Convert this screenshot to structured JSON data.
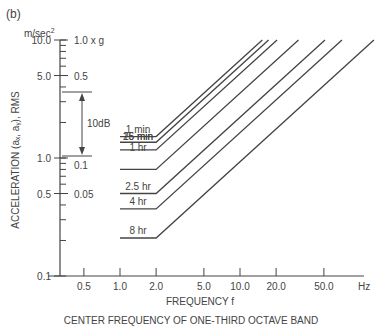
{
  "panel_label": "(b)",
  "y_unit": "m/sec²",
  "chart_data": {
    "type": "line",
    "title": "",
    "xlabel": "FREQUENCY f",
    "x_unit": "Hz",
    "caption": "CENTER FREQUENCY OF ONE-THIRD OCTAVE BAND",
    "ylabel": "ACCELERATION (aₓ, aᵧ), RMS",
    "x_scale": "log",
    "y_scale": "log",
    "xlim": [
      0.3,
      80
    ],
    "ylim": [
      0.1,
      10.0
    ],
    "x_ticks": [
      "0.5",
      "1.0",
      "2.0",
      "5.0",
      "10.0",
      "20.0",
      "50.0"
    ],
    "y_ticks": [
      "0.1",
      "0.5",
      "1.0",
      "5.0",
      "10.0"
    ],
    "y_ticks_g": [
      "0.05",
      "0.1",
      "0.5",
      "1.0 x g"
    ],
    "annotation": "10dB",
    "series": [
      {
        "name": "1 min",
        "flat_value": 1.52,
        "x_start": 1.0,
        "x_corner": 2.0
      },
      {
        "name": "16 min",
        "flat_value": 1.36,
        "x_start": 1.0,
        "x_corner": 2.0
      },
      {
        "name": "25 min",
        "flat_value": 1.17,
        "x_start": 1.0,
        "x_corner": 2.0
      },
      {
        "name": "1 hr",
        "flat_value": 0.8,
        "x_start": 1.0,
        "x_corner": 2.0
      },
      {
        "name": "2.5 hr",
        "flat_value": 0.5,
        "x_start": 1.0,
        "x_corner": 2.0
      },
      {
        "name": "4 hr",
        "flat_value": 0.37,
        "x_start": 1.0,
        "x_corner": 2.0
      },
      {
        "name": "8 hr",
        "flat_value": 0.21,
        "x_start": 1.0,
        "x_corner": 2.0
      }
    ],
    "grid": false,
    "legend_position": "inline-left"
  }
}
